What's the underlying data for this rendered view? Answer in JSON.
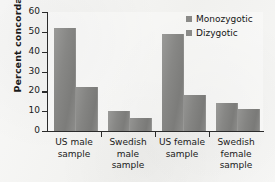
{
  "chart_data": {
    "type": "bar",
    "title": "",
    "xlabel": "",
    "ylabel": "Percent concordance",
    "ylim": [
      0,
      60
    ],
    "yticks": [
      0,
      10,
      20,
      30,
      40,
      50,
      60
    ],
    "grid": false,
    "legend_position": "top-right",
    "categories": [
      "US male sample",
      "Swedish male sample",
      "US female sample",
      "Swedish female sample"
    ],
    "category_lines": [
      [
        "US male",
        "sample"
      ],
      [
        "Swedish",
        "male",
        "sample"
      ],
      [
        "US female",
        "sample"
      ],
      [
        "Swedish",
        "female",
        "sample"
      ]
    ],
    "series": [
      {
        "name": "Monozygotic",
        "values": [
          52,
          10,
          49,
          14
        ],
        "color": "#8a8a88"
      },
      {
        "name": "Dizygotic",
        "values": [
          22,
          6.5,
          18,
          11
        ],
        "color": "#848482"
      }
    ]
  },
  "axis": {
    "y_title": "Percent concordance",
    "y_ticks": [
      "60",
      "50",
      "40",
      "30",
      "20",
      "10",
      "0"
    ]
  },
  "legend": {
    "items": [
      {
        "label": "Monozygotic"
      },
      {
        "label": "Dizygotic"
      }
    ]
  },
  "colors": {
    "paper": "#f2f2f0",
    "axis": "#2b2b2b",
    "bar_monozygotic": "#8a8a88",
    "bar_dizygotic": "#848482",
    "text": "#1a1a1a"
  }
}
